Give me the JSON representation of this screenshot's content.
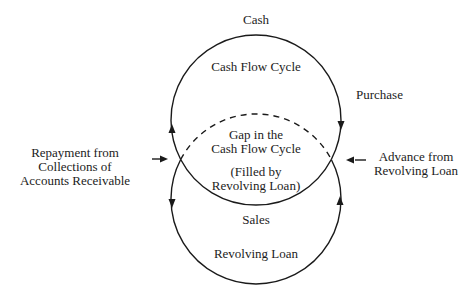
{
  "labels": {
    "cash": "Cash",
    "cash_flow_cycle": "Cash Flow Cycle",
    "purchase": "Purchase",
    "gap_line1": "Gap in the",
    "gap_line2": "Cash Flow Cycle",
    "filled_line1": "(Filled by",
    "filled_line2": "Revolving Loan)",
    "repayment_line1": "Repayment from",
    "repayment_line2": "Collections of",
    "repayment_line3": "Accounts Receivable",
    "advance_line1": "Advance from",
    "advance_line2": "Revolving Loan",
    "sales": "Sales",
    "revolving_loan": "Revolving Loan"
  },
  "geometry": {
    "top_circle": {
      "cx": 256,
      "cy": 120,
      "r": 85
    },
    "bottom_circle": {
      "cx": 256,
      "cy": 199,
      "r": 85
    },
    "stroke_color": "#1a1a1a"
  }
}
